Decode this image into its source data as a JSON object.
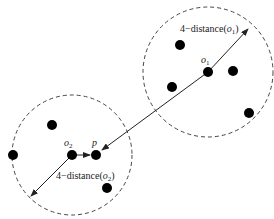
{
  "diagram": {
    "clusters": [
      {
        "id": "o1-neighborhood",
        "center": [
          208,
          72
        ],
        "radius": 65
      },
      {
        "id": "o2-neighborhood",
        "center": [
          72,
          155
        ],
        "radius": 60
      }
    ],
    "points": [
      {
        "name": "o1",
        "x": 208,
        "y": 72,
        "label": "o",
        "sub": "1"
      },
      {
        "name": "pt-a",
        "x": 180,
        "y": 45
      },
      {
        "name": "pt-b",
        "x": 233,
        "y": 71
      },
      {
        "name": "pt-c",
        "x": 172,
        "y": 87
      },
      {
        "name": "pt-d",
        "x": 249,
        "y": 113
      },
      {
        "name": "o2",
        "x": 72,
        "y": 155,
        "label": "o",
        "sub": "2"
      },
      {
        "name": "p",
        "x": 96,
        "y": 155,
        "label": "p"
      },
      {
        "name": "pt-e",
        "x": 52,
        "y": 125
      },
      {
        "name": "pt-f",
        "x": 13,
        "y": 155
      },
      {
        "name": "pt-g",
        "x": 107,
        "y": 188
      }
    ],
    "labels": {
      "o1": {
        "base": "o",
        "sub": "1"
      },
      "o2": {
        "base": "o",
        "sub": "2"
      },
      "p": "p",
      "dist1_prefix": "4−distance(",
      "dist1_var": "o",
      "dist1_sub": "1",
      "dist1_suffix": ")",
      "dist2_prefix": "4−distance(",
      "dist2_var": "o",
      "dist2_sub": "2",
      "dist2_suffix": ")"
    },
    "colors": {
      "point": "#000000",
      "line": "#222222",
      "circle": "#444444"
    }
  }
}
